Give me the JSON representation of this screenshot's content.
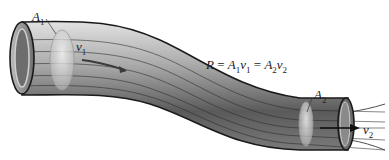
{
  "diagram": {
    "labels": {
      "a1": {
        "base": "A",
        "sub": "1"
      },
      "v1": {
        "base": "v",
        "sub": "1"
      },
      "a2": {
        "base": "A",
        "sub": "2"
      },
      "v2": {
        "base": "v",
        "sub": "2"
      }
    },
    "equation": {
      "r": "R",
      "eq1": " = ",
      "a1": "A",
      "a1sub": "1",
      "v1": "v",
      "v1sub": "1",
      "eq2": " = ",
      "a2": "A",
      "a2sub": "2",
      "v2": "v",
      "v2sub": "2"
    },
    "colors": {
      "tube_dark": "#4a4a4a",
      "tube_mid": "#8c8c8c",
      "tube_light": "#d4d4d4",
      "outline": "#1a1a1a",
      "background": "#ffffff"
    }
  }
}
